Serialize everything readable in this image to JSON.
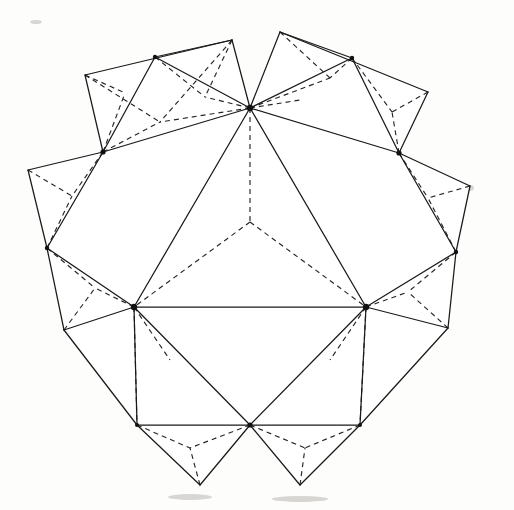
{
  "figure": {
    "title": "Polyhedron net diagram",
    "background_color": "#fdfdfc",
    "solid_line_color": "#1a1a1a",
    "dashed_line_color": "#262626",
    "canvas": {
      "width": 514,
      "height": 510
    }
  },
  "geometry": {
    "center": {
      "x": 250,
      "y": 250
    },
    "hubs": [
      {
        "name": "hub-top",
        "x": 250,
        "y": 108
      },
      {
        "name": "hub-upper-right",
        "x": 399,
        "y": 153
      },
      {
        "name": "hub-lower-right",
        "x": 366,
        "y": 307
      },
      {
        "name": "hub-lower-left",
        "x": 134,
        "y": 307
      },
      {
        "name": "hub-upper-left",
        "x": 103,
        "y": 152
      }
    ],
    "ring_mid_vertices": [
      {
        "name": "mid-top-right",
        "x": 352,
        "y": 58
      },
      {
        "name": "mid-right",
        "x": 456,
        "y": 252
      },
      {
        "name": "mid-bottom",
        "x": 250,
        "y": 425
      },
      {
        "name": "mid-left",
        "x": 47,
        "y": 248
      },
      {
        "name": "mid-top-left",
        "x": 155,
        "y": 57
      }
    ],
    "outer_corners": [
      {
        "name": "corner-top-left-a",
        "x": 85,
        "y": 75
      },
      {
        "name": "corner-top-left-b",
        "x": 232,
        "y": 40
      },
      {
        "name": "corner-top-right-a",
        "x": 280,
        "y": 32
      },
      {
        "name": "corner-top-right-b",
        "x": 428,
        "y": 92
      },
      {
        "name": "corner-right-a",
        "x": 470,
        "y": 186
      },
      {
        "name": "corner-right-b",
        "x": 448,
        "y": 328
      },
      {
        "name": "corner-bottom-right-a",
        "x": 360,
        "y": 425
      },
      {
        "name": "corner-bottom-right-b",
        "x": 300,
        "y": 485
      },
      {
        "name": "corner-bottom-left-a",
        "x": 200,
        "y": 485
      },
      {
        "name": "corner-bottom-left-b",
        "x": 137,
        "y": 425
      },
      {
        "name": "corner-left-a",
        "x": 64,
        "y": 330
      },
      {
        "name": "corner-left-b",
        "x": 28,
        "y": 170
      }
    ],
    "inner_dashed_pentagon": [
      {
        "x": 250,
        "y": 222
      },
      {
        "x": 305,
        "y": 290
      },
      {
        "x": 250,
        "y": 300
      },
      {
        "x": 195,
        "y": 290
      }
    ],
    "line_counts": {
      "solid_edges": 58,
      "dashed_edges": 44,
      "vertex_dots": 11
    }
  },
  "legend": {
    "solid_label": "solid edge",
    "dashed_label": "fold / hidden edge"
  }
}
